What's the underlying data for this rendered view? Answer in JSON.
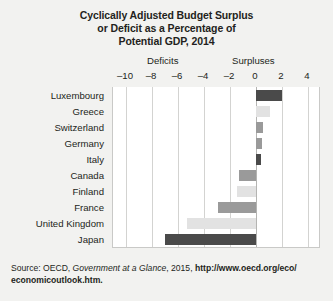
{
  "title": {
    "line1": "Cyclically Adjusted Budget Surplus",
    "line2": "or Deficit as a Percentage of",
    "line3": "Potential GDP, 2014"
  },
  "axis_headers": {
    "deficits": "Deficits",
    "surpluses": "Surpluses"
  },
  "source": {
    "prefix": "Source: OECD, ",
    "italic": "Government at a Glance",
    "middle": ", 2015, ",
    "url_line1": "http://www.oecd.org/eco/",
    "url_line2": "economicoutlook.htm."
  },
  "colors": {
    "dark": "#4a4a4a",
    "mid": "#9a9a9a",
    "light": "#e2e2e2",
    "plot_bg": "#ffffff",
    "grid": "#d3d3d1",
    "page_bg": "#f2f2f0",
    "text": "#231f20"
  },
  "chart_data": {
    "type": "bar",
    "orientation": "horizontal",
    "title": "Cyclically Adjusted Budget Surplus or Deficit as a Percentage of Potential GDP, 2014",
    "xlabel": "",
    "ylabel": "",
    "xlim": [
      -11,
      5
    ],
    "grid": true,
    "legend": "none",
    "tick_labels": [
      "-10",
      "-8",
      "-6",
      "-4",
      "-2",
      "0",
      "2",
      "4"
    ],
    "ticks": [
      -10,
      -8,
      -6,
      -4,
      -2,
      0,
      2,
      4
    ],
    "categories": [
      "Luxembourg",
      "Greece",
      "Switzerland",
      "Germany",
      "Italy",
      "Canada",
      "Finland",
      "France",
      "United Kingdom",
      "Japan"
    ],
    "values": [
      2.0,
      1.1,
      0.5,
      0.45,
      0.4,
      -1.3,
      -1.5,
      -2.9,
      -5.3,
      -7.0
    ],
    "bar_shades": [
      "dark",
      "light",
      "mid",
      "mid",
      "dark",
      "mid",
      "light",
      "mid",
      "light",
      "dark"
    ]
  }
}
